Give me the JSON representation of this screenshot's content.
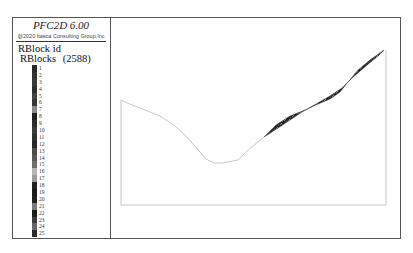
{
  "legend": {
    "title": "PFC2D 6.00",
    "copyright": "@2020 Itasca Consulting Group,Inc",
    "label": "RBlock id",
    "group": "RBlocks",
    "count": "(2588)",
    "items": [
      {
        "id": "1",
        "color": "#2a2a2a"
      },
      {
        "id": "2",
        "color": "#333333"
      },
      {
        "id": "3",
        "color": "#3a3a3a"
      },
      {
        "id": "4",
        "color": "#2e2e2e"
      },
      {
        "id": "5",
        "color": "#444444"
      },
      {
        "id": "6",
        "color": "#383838"
      },
      {
        "id": "7",
        "color": "#8a8a8a"
      },
      {
        "id": "8",
        "color": "#1e1e1e"
      },
      {
        "id": "9",
        "color": "#2c2c2c"
      },
      {
        "id": "10",
        "color": "#3c3c3c"
      },
      {
        "id": "11",
        "color": "#303030"
      },
      {
        "id": "12",
        "color": "#262626"
      },
      {
        "id": "13",
        "color": "#4a4a4a"
      },
      {
        "id": "14",
        "color": "#5a5a5a"
      },
      {
        "id": "15",
        "color": "#6e6e6e"
      },
      {
        "id": "16",
        "color": "#b5b5b5"
      },
      {
        "id": "17",
        "color": "#9a9a9a"
      },
      {
        "id": "18",
        "color": "#222222"
      },
      {
        "id": "19",
        "color": "#1a1a1a"
      },
      {
        "id": "20",
        "color": "#202020"
      },
      {
        "id": "21",
        "color": "#7a7a7a"
      },
      {
        "id": "22",
        "color": "#1c1c1c"
      },
      {
        "id": "23",
        "color": "#3e3e3e"
      },
      {
        "id": "24",
        "color": "#666666"
      },
      {
        "id": "25",
        "color": "#2a2a2a"
      }
    ]
  },
  "plot": {
    "domain_box": {
      "left": 121,
      "top": 50,
      "right": 386,
      "bottom": 205
    },
    "boundary_color": "#c8c8c8",
    "block_color": "#2b2b2b"
  }
}
